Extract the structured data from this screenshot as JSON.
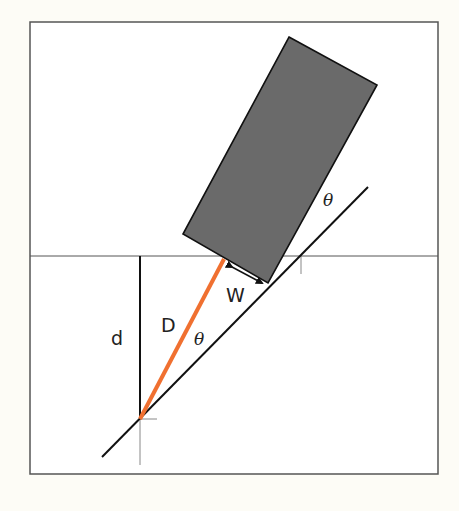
{
  "diagram": {
    "colors": {
      "background": "#fdfcf6",
      "frame": "#555555",
      "block_fill": "#6a6a6a",
      "block_stroke": "#111111",
      "highlight_line": "#f07030",
      "line": "#111111",
      "guide": "#777777"
    },
    "labels": {
      "d": "d",
      "D": "D",
      "W": "W",
      "theta_lower": "θ",
      "theta_upper": "θ"
    },
    "elements": [
      {
        "name": "frame",
        "type": "rect"
      },
      {
        "name": "horizontal-reference-line",
        "type": "line"
      },
      {
        "name": "incline-line",
        "type": "line"
      },
      {
        "name": "block",
        "type": "polygon"
      },
      {
        "name": "vertical-depth-line",
        "label": "d"
      },
      {
        "name": "diagonal-distance-line",
        "label": "D"
      },
      {
        "name": "width-arrow",
        "label": "W"
      },
      {
        "name": "angle-theta-lower",
        "label": "θ"
      },
      {
        "name": "angle-theta-upper",
        "label": "θ"
      }
    ]
  }
}
